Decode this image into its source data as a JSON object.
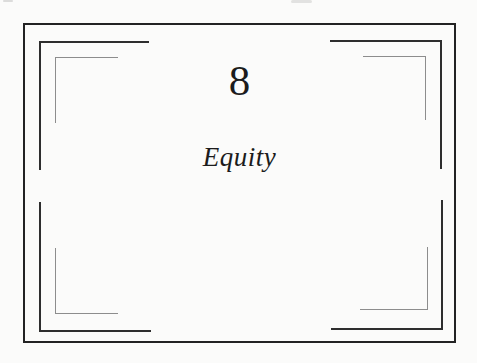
{
  "page": {
    "chapter_number": "8",
    "chapter_title": "Equity"
  },
  "colors": {
    "paper": "#fbfbfa",
    "ink": "#1c1c1c",
    "frame_border": "#232323",
    "bracket_dark": "#2e2e2e",
    "bracket_light": "#8d8d8d"
  }
}
